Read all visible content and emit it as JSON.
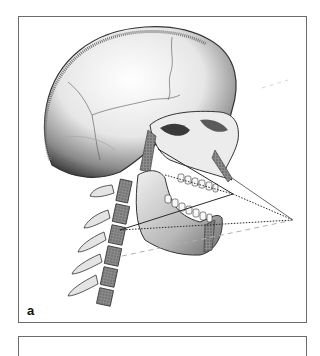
{
  "figure": {
    "panel_label": "a",
    "illustrator_signature": "illegible",
    "colors": {
      "border": "#6a6a6a",
      "bone_light": "#f4f4f4",
      "bone_shadow": "#5a5a5a",
      "line_dark": "#2a2a2a",
      "line_light": "#b0b0b0"
    },
    "projection_lines": [
      {
        "style": "solid",
        "from": [
          158,
          149
        ],
        "to": [
          233,
          194
        ]
      },
      {
        "style": "dotted",
        "from": [
          165,
          175
        ],
        "to": [
          233,
          194
        ]
      },
      {
        "style": "solid",
        "from": [
          120,
          230
        ],
        "to": [
          233,
          194
        ]
      },
      {
        "style": "solid",
        "from": [
          232,
          178
        ],
        "to": [
          293,
          220
        ]
      },
      {
        "style": "dotted",
        "from": [
          233,
          194
        ],
        "to": [
          293,
          220
        ]
      },
      {
        "style": "dotted",
        "from": [
          120,
          230
        ],
        "to": [
          293,
          220
        ]
      },
      {
        "style": "dashed-light",
        "from": [
          122,
          256
        ],
        "to": [
          293,
          220
        ]
      }
    ]
  }
}
